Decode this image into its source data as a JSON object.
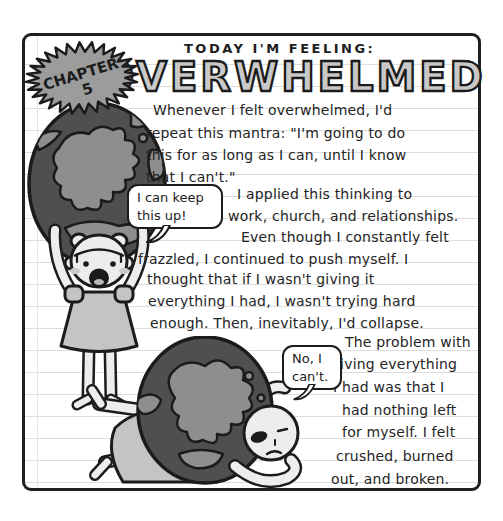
{
  "page": {
    "kicker": "TODAY I'M FEELING:",
    "title": "OVERWHELMED",
    "chapter_badge": {
      "word": "CHAPTER",
      "number": "5"
    }
  },
  "story": {
    "lines": [
      "Whenever I felt overwhelmed, I'd",
      "repeat this mantra: \"I'm going to do",
      "this for as long as I can, until I know",
      "that I can't.\"",
      "I applied this thinking to",
      "work, church, and relationships.",
      "Even though I constantly felt",
      "frazzled, I continued to push myself. I",
      "thought that if I wasn't giving it",
      "everything I had, I wasn't trying hard",
      "enough. Then, inevitably, I'd collapse.",
      "The problem with",
      "giving everything",
      "I had was that I",
      "had nothing left",
      "for myself. I felt",
      "crushed, burned",
      "out, and broken."
    ]
  },
  "speech_bubbles": {
    "standing": "I can keep this up!",
    "crushed": "No, I can't."
  },
  "colors": {
    "ink": "#1c1c1c",
    "paper": "#ffffff",
    "paper_line": "#dddddd",
    "globe_ocean": "#4f4f4f",
    "globe_land": "#8e8e8e",
    "dress": "#c4c4c4",
    "skin": "#ededed",
    "badge_fill": "#9c9c9c",
    "title_fill": "#c9c9c9"
  }
}
